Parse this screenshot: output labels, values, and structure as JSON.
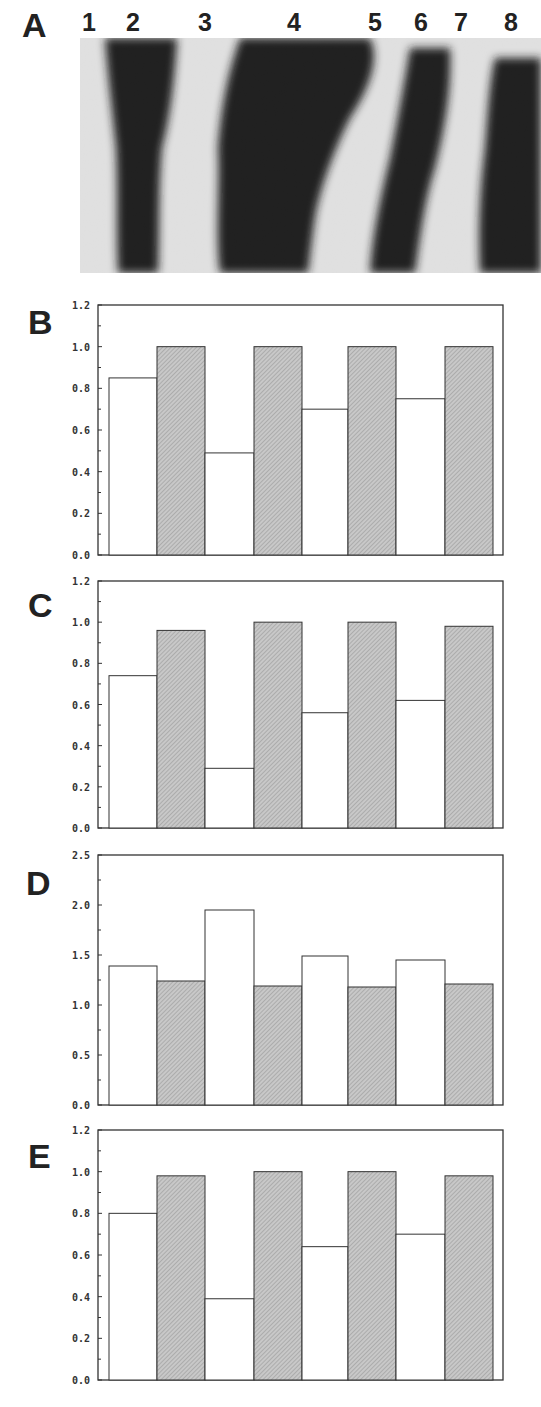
{
  "panel_a": {
    "letter": "A",
    "lane_labels": [
      {
        "label": "1",
        "x": 82
      },
      {
        "label": "2",
        "x": 126
      },
      {
        "label": "3",
        "x": 198
      },
      {
        "label": "4",
        "x": 287
      },
      {
        "label": "5",
        "x": 368
      },
      {
        "label": "6",
        "x": 414
      },
      {
        "label": "7",
        "x": 454
      },
      {
        "label": "8",
        "x": 504
      }
    ],
    "bands": [
      {
        "lane": "2",
        "dark": true
      },
      {
        "lane": "4",
        "dark": true
      },
      {
        "lane": "6",
        "dark": true
      },
      {
        "lane": "8",
        "dark": true
      }
    ]
  },
  "colors": {
    "white_bar": "#ffffff",
    "gray_bar": "#c8c8c8",
    "gray_hatch": "#9a9a9a",
    "axis": "#333333",
    "gel_dark": "#1e1e1e",
    "gel_light": "#e8e8e8"
  },
  "chart_data": [
    {
      "panel": "B",
      "type": "bar",
      "title": "",
      "xlabel": "",
      "ylabel": "",
      "ylim": [
        0,
        1.2
      ],
      "yticks": [
        "0.0",
        "0.2",
        "0.4",
        "0.6",
        "0.8",
        "1.0",
        "1.2"
      ],
      "categories": [
        "1",
        "2",
        "3",
        "4",
        "5",
        "6",
        "7",
        "8"
      ],
      "series": [
        {
          "name": "open (odd lanes)",
          "values": [
            0.85,
            0.49,
            0.7,
            0.75
          ]
        },
        {
          "name": "shaded (even lanes)",
          "values": [
            1.0,
            1.0,
            1.0,
            1.0
          ]
        }
      ],
      "bars_in_order": [
        0.85,
        1.0,
        0.49,
        1.0,
        0.7,
        1.0,
        0.75,
        1.0
      ],
      "grid": false,
      "legend": "none"
    },
    {
      "panel": "C",
      "type": "bar",
      "title": "",
      "xlabel": "",
      "ylabel": "",
      "ylim": [
        0,
        1.2
      ],
      "yticks": [
        "0.0",
        "0.2",
        "0.4",
        "0.6",
        "0.8",
        "1.0",
        "1.2"
      ],
      "categories": [
        "1",
        "2",
        "3",
        "4",
        "5",
        "6",
        "7",
        "8"
      ],
      "series": [
        {
          "name": "open (odd lanes)",
          "values": [
            0.74,
            0.29,
            0.56,
            0.62
          ]
        },
        {
          "name": "shaded (even lanes)",
          "values": [
            0.96,
            1.0,
            1.0,
            0.98
          ]
        }
      ],
      "bars_in_order": [
        0.74,
        0.96,
        0.29,
        1.0,
        0.56,
        1.0,
        0.62,
        0.98
      ],
      "grid": false,
      "legend": "none"
    },
    {
      "panel": "D",
      "type": "bar",
      "title": "",
      "xlabel": "",
      "ylabel": "",
      "ylim": [
        0,
        2.5
      ],
      "yticks": [
        "0.0",
        "0.5",
        "1.0",
        "1.5",
        "2.0",
        "2.5"
      ],
      "categories": [
        "1",
        "2",
        "3",
        "4",
        "5",
        "6",
        "7",
        "8"
      ],
      "series": [
        {
          "name": "open (odd lanes)",
          "values": [
            1.39,
            1.95,
            1.49,
            1.45
          ]
        },
        {
          "name": "shaded (even lanes)",
          "values": [
            1.24,
            1.19,
            1.18,
            1.21
          ]
        }
      ],
      "bars_in_order": [
        1.39,
        1.24,
        1.95,
        1.19,
        1.49,
        1.18,
        1.45,
        1.21
      ],
      "grid": false,
      "legend": "none"
    },
    {
      "panel": "E",
      "type": "bar",
      "title": "",
      "xlabel": "",
      "ylabel": "",
      "ylim": [
        0,
        1.2
      ],
      "yticks": [
        "0.0",
        "0.2",
        "0.4",
        "0.6",
        "0.8",
        "1.0",
        "1.2"
      ],
      "categories": [
        "1",
        "2",
        "3",
        "4",
        "5",
        "6",
        "7",
        "8"
      ],
      "series": [
        {
          "name": "open (odd lanes)",
          "values": [
            0.8,
            0.39,
            0.64,
            0.7
          ]
        },
        {
          "name": "shaded (even lanes)",
          "values": [
            0.98,
            1.0,
            1.0,
            0.98
          ]
        }
      ],
      "bars_in_order": [
        0.8,
        0.98,
        0.39,
        1.0,
        0.64,
        1.0,
        0.7,
        0.98
      ],
      "grid": false,
      "legend": "none"
    }
  ],
  "layout": {
    "panels": [
      {
        "letter": "B",
        "letter_x": 28,
        "letter_y": 305,
        "top": 305,
        "bottom": 555
      },
      {
        "letter": "C",
        "letter_x": 28,
        "letter_y": 588,
        "top": 581,
        "bottom": 828
      },
      {
        "letter": "D",
        "letter_x": 26,
        "letter_y": 866,
        "top": 855,
        "bottom": 1105
      },
      {
        "letter": "E",
        "letter_x": 28,
        "letter_y": 1139,
        "top": 1130,
        "bottom": 1380
      }
    ],
    "axis_left": 98,
    "axis_right": 503,
    "bar_edges": [
      109,
      157,
      205,
      254,
      302,
      348,
      396,
      445,
      493
    ]
  }
}
